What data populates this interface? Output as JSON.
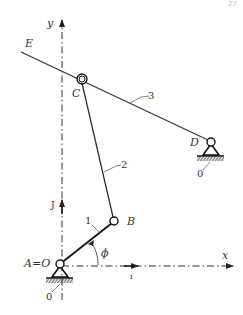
{
  "page": {
    "number": "27"
  },
  "diagram": {
    "type": "four-bar mechanism kinematic sketch",
    "axes": {
      "x_label": "x",
      "y_label": "y",
      "unit_x": "ı",
      "unit_y": "J"
    },
    "points": {
      "A": {
        "label": "A=O",
        "x": 60,
        "y": 264
      },
      "B": {
        "label": "B",
        "x": 114,
        "y": 221
      },
      "C": {
        "label": "C",
        "x": 82,
        "y": 80
      },
      "D": {
        "label": "D",
        "x": 211,
        "y": 142
      },
      "E": {
        "label": "E",
        "x": 21,
        "y": 52
      }
    },
    "links": [
      {
        "id": "1",
        "from": "A",
        "to": "B"
      },
      {
        "id": "2",
        "from": "B",
        "to": "C"
      },
      {
        "id": "3",
        "from": "E",
        "to": "D",
        "note": "bar passes through slider C"
      }
    ],
    "ground_labels": [
      "0",
      "0"
    ],
    "angle_label": "ϕ",
    "colors": {
      "ink": "#333333",
      "background": "#ffffff"
    }
  }
}
